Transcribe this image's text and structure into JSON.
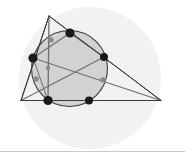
{
  "figure": {
    "canvas": {
      "width": 185,
      "height": 161,
      "background": "#ffffff"
    },
    "background_disc": {
      "name": "pale-background-circle",
      "cx": 90,
      "cy": 78,
      "r": 71,
      "fill": "#f2f2f2",
      "stroke": "none"
    },
    "main_circle": {
      "name": "main-circle",
      "cx": 69.5,
      "cy": 68.5,
      "r": 38,
      "fill": "#d2d2d2",
      "stroke": "#3a3a3a",
      "stroke_width": 1.1
    },
    "triangle": {
      "name": "outer-triangle",
      "stroke": "#3a3a3a",
      "stroke_width": 1.0,
      "fill": "none",
      "vertices": [
        {
          "label": "apex",
          "x": 49,
          "y": 16
        },
        {
          "label": "left",
          "x": 21,
          "y": 100.5
        },
        {
          "label": "right",
          "x": 161,
          "y": 100.5
        }
      ]
    },
    "segments": [
      {
        "name": "segment-apex-to-left-base",
        "x1": 49,
        "y1": 16,
        "x2": 21,
        "y2": 100.5,
        "stroke": "#3a3a3a",
        "stroke_width": 1.0
      },
      {
        "name": "segment-apex-to-right-base",
        "x1": 49,
        "y1": 16,
        "x2": 161,
        "y2": 100.5,
        "stroke": "#3a3a3a",
        "stroke_width": 1.0
      },
      {
        "name": "segment-base-line",
        "x1": 21,
        "y1": 100.5,
        "x2": 161,
        "y2": 100.5,
        "stroke": "#3a3a3a",
        "stroke_width": 1.0
      },
      {
        "name": "cevian-apex-to-base-point",
        "x1": 49,
        "y1": 16,
        "x2": 48,
        "y2": 100.5,
        "stroke": "#6e6e6e",
        "stroke_width": 1.3
      },
      {
        "name": "cevian-left-vertex-to-right-dot",
        "x1": 21,
        "y1": 100.5,
        "x2": 104,
        "y2": 57,
        "stroke": "#6e6e6e",
        "stroke_width": 1.1
      },
      {
        "name": "cevian-left-dot-to-right-vertex",
        "x1": 33,
        "y1": 58,
        "x2": 161,
        "y2": 100.5,
        "stroke": "#6e6e6e",
        "stroke_width": 1.1
      },
      {
        "name": "chord-left-dot-to-top-dot",
        "x1": 33,
        "y1": 58,
        "x2": 70,
        "y2": 33,
        "stroke": "#6e6e6e",
        "stroke_width": 1.1
      },
      {
        "name": "chord-top-dot-to-right-dot",
        "x1": 70,
        "y1": 33,
        "x2": 104,
        "y2": 57,
        "stroke": "#6e6e6e",
        "stroke_width": 1.1
      },
      {
        "name": "chord-left-dot-to-bottom-left-dot",
        "x1": 33,
        "y1": 58,
        "x2": 48,
        "y2": 100.5,
        "stroke": "#6e6e6e",
        "stroke_width": 1.0
      }
    ],
    "black_points": [
      {
        "name": "point-top",
        "x": 70,
        "y": 33,
        "r": 4.6
      },
      {
        "name": "point-left",
        "x": 33,
        "y": 58,
        "r": 4.6
      },
      {
        "name": "point-right",
        "x": 104,
        "y": 57,
        "r": 4.0
      },
      {
        "name": "point-bottom-left",
        "x": 48,
        "y": 100.5,
        "r": 4.6
      },
      {
        "name": "point-bottom-right",
        "x": 89,
        "y": 100.5,
        "r": 4.0
      }
    ],
    "gray_points": [
      {
        "name": "gray-point-upper-left",
        "x": 51,
        "y": 40,
        "r": 2.8
      },
      {
        "name": "gray-point-center",
        "x": 48,
        "y": 68,
        "r": 2.2
      },
      {
        "name": "gray-point-lower-left",
        "x": 36,
        "y": 79,
        "r": 2.8
      },
      {
        "name": "gray-point-lower-right",
        "x": 103,
        "y": 80,
        "r": 2.8
      }
    ],
    "point_colors": {
      "black": "#1a1a1a",
      "gray": "#8a8a8a"
    },
    "footer_divider": {
      "name": "footer-divider",
      "y": 151,
      "color": "#c9c9c9"
    }
  }
}
